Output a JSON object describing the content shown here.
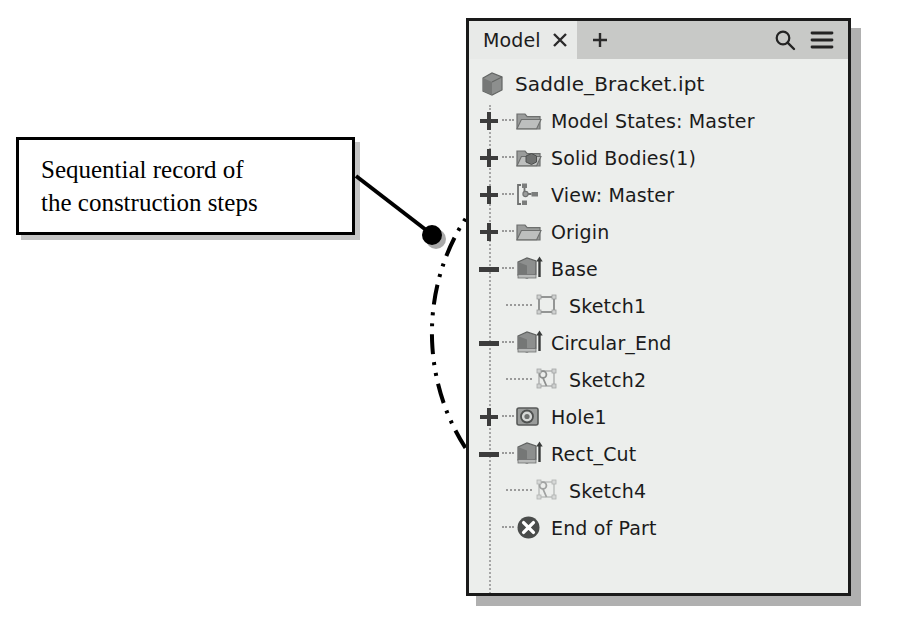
{
  "callout": {
    "line1": "Sequential record of",
    "line2": "the construction steps"
  },
  "panel": {
    "tab": {
      "label": "Model",
      "close_icon": "close-icon",
      "new_tab_icon": "plus-icon"
    },
    "tools": {
      "search_icon": "search-icon",
      "menu_icon": "hamburger-menu-icon"
    },
    "root": {
      "label": "Saddle_Bracket.ipt",
      "icon": "part-cube-icon"
    },
    "tree": [
      {
        "label": "Model States: Master",
        "icon": "folder-icon",
        "expander": "plus",
        "indent": 0
      },
      {
        "label": "Solid Bodies(1)",
        "icon": "folder-solid-icon",
        "expander": "plus",
        "indent": 0
      },
      {
        "label": "View: Master",
        "icon": "view-icon",
        "expander": "plus",
        "indent": 0
      },
      {
        "label": "Origin",
        "icon": "folder-icon",
        "expander": "plus",
        "indent": 0
      },
      {
        "label": "Base",
        "icon": "extrude-icon",
        "expander": "minus",
        "indent": 0
      },
      {
        "label": "Sketch1",
        "icon": "sketch-square-icon",
        "expander": "none",
        "indent": 1
      },
      {
        "label": "Circular_End",
        "icon": "extrude-icon",
        "expander": "minus",
        "indent": 0
      },
      {
        "label": "Sketch2",
        "icon": "sketch-arc-icon",
        "expander": "none",
        "indent": 1
      },
      {
        "label": "Hole1",
        "icon": "hole-icon",
        "expander": "plus",
        "indent": 0
      },
      {
        "label": "Rect_Cut",
        "icon": "extrude-icon",
        "expander": "minus",
        "indent": 0
      },
      {
        "label": "Sketch4",
        "icon": "sketch-arc-icon",
        "expander": "none",
        "indent": 1
      },
      {
        "label": "End of Part",
        "icon": "end-of-part-icon",
        "expander": "none",
        "indent": 0
      }
    ]
  },
  "annotation": {
    "highlight_shape": "dash-dot-ellipse",
    "leader_dot": "leader-endpoint-dot"
  },
  "colors": {
    "panel_bg": "#eceeec",
    "tabbar_bg": "#c8c9c7",
    "active_tab_bg": "#e8eae8",
    "border": "#1a1a1a",
    "icon_gray": "#8d8f8e",
    "text": "#1b1b1b",
    "shadow": "#969696"
  }
}
